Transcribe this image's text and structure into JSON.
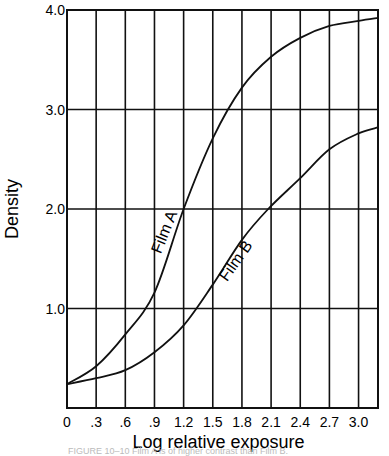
{
  "chart_data": {
    "type": "line",
    "title": "",
    "xlabel": "Log relative exposure",
    "ylabel": "Density",
    "xlim": [
      0,
      3.2
    ],
    "ylim": [
      0,
      4.0
    ],
    "grid": true,
    "x_ticks": [
      "0",
      ".3",
      ".6",
      ".9",
      "1.2",
      "1.5",
      "1.8",
      "2.1",
      "2.4",
      "2.7",
      "3.0"
    ],
    "x_tick_values": [
      0,
      0.3,
      0.6,
      0.9,
      1.2,
      1.5,
      1.8,
      2.1,
      2.4,
      2.7,
      3.0
    ],
    "y_ticks": [
      "1.0",
      "2.0",
      "3.0",
      "4.0"
    ],
    "y_tick_values": [
      1.0,
      2.0,
      3.0,
      4.0
    ],
    "series": [
      {
        "name": "Film A",
        "x": [
          0,
          0.3,
          0.6,
          0.9,
          1.2,
          1.5,
          1.8,
          2.1,
          2.4,
          2.7,
          3.0,
          3.2
        ],
        "y": [
          0.24,
          0.42,
          0.74,
          1.16,
          2.0,
          2.71,
          3.22,
          3.53,
          3.72,
          3.84,
          3.89,
          3.92
        ],
        "label_pos": {
          "x": 1.05,
          "y": 1.75,
          "angle": -68
        }
      },
      {
        "name": "Film B",
        "x": [
          0,
          0.3,
          0.6,
          0.9,
          1.2,
          1.5,
          1.8,
          2.07,
          2.4,
          2.7,
          3.0,
          3.2
        ],
        "y": [
          0.24,
          0.3,
          0.38,
          0.56,
          0.83,
          1.24,
          1.69,
          2.0,
          2.31,
          2.6,
          2.76,
          2.82
        ],
        "label_pos": {
          "x": 1.78,
          "y": 1.45,
          "angle": -55
        }
      }
    ]
  },
  "caption": "FIGURE 10–10 Film A is of higher contrast than Film B."
}
